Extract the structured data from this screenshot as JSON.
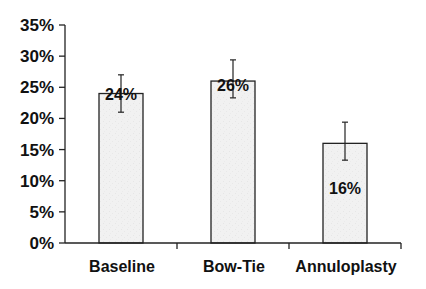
{
  "chart_data": {
    "type": "bar",
    "title": "",
    "xlabel": "",
    "ylabel": "",
    "categories": [
      "Baseline",
      "Bow-Tie",
      "Annuloplasty"
    ],
    "values": [
      24,
      26,
      16
    ],
    "value_labels": [
      "24%",
      "26%",
      "16%"
    ],
    "error_bars": [
      {
        "low": 21,
        "high": 27
      },
      {
        "low": 23.3,
        "high": 29.4
      },
      {
        "low": 13.3,
        "high": 19.4
      }
    ],
    "ylim": [
      0,
      35
    ],
    "yticks": [
      0,
      5,
      10,
      15,
      20,
      25,
      30,
      35
    ],
    "ytick_labels": [
      "0%",
      "5%",
      "10%",
      "15%",
      "20%",
      "25%",
      "30%",
      "35%"
    ],
    "grid": false,
    "legend": null,
    "bar_fill": "#f1f1f1",
    "bar_stroke": "#222222",
    "value_label_y": [
      24,
      25.3,
      8.8
    ]
  }
}
